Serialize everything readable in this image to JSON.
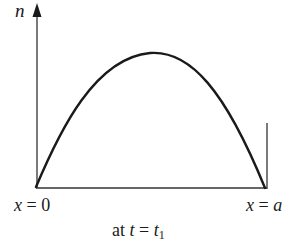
{
  "diagram": {
    "y_axis_label": "n",
    "x_start_label": {
      "var": "x",
      "eq": " = ",
      "val": "0"
    },
    "x_end_label": {
      "var": "x",
      "eq": " = ",
      "val": "a"
    },
    "caption": {
      "prefix": "at ",
      "var": "t",
      "eq": " = ",
      "val": "t",
      "sub": "1"
    },
    "colors": {
      "line": "#1a1a1a",
      "background": "#ffffff"
    },
    "curve": {
      "shape": "skewed-parabola",
      "start": [
        36,
        187
      ],
      "peak": [
        155,
        53
      ],
      "end": [
        265,
        188
      ]
    }
  }
}
